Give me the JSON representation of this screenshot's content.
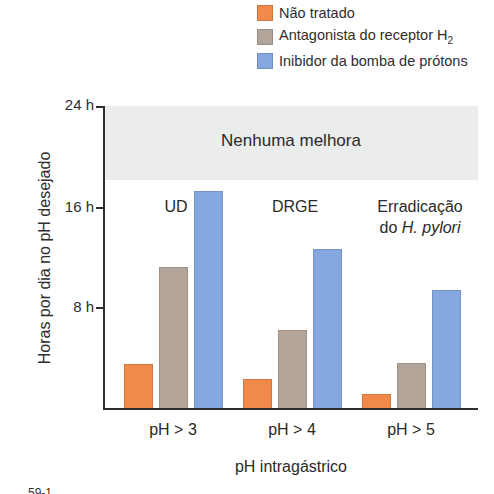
{
  "chart_data": {
    "type": "bar",
    "title": "",
    "xlabel": "pH intragástrico",
    "ylabel": "Horas por dia no pH desejado",
    "ylim": [
      0,
      24
    ],
    "yticks": [
      "8 h",
      "16 h",
      "24 h"
    ],
    "categories": [
      "pH > 3",
      "pH > 4",
      "pH > 5"
    ],
    "category_annotations": [
      "UD",
      "DRGE",
      "Erradicação do H. pylori"
    ],
    "series": [
      {
        "name": "Não tratado",
        "color": "#f0894a",
        "values": [
          3.5,
          2.3,
          1.1
        ]
      },
      {
        "name": "Antagonista do receptor H2",
        "color": "#b4a59a",
        "values": [
          11.2,
          6.2,
          3.6
        ]
      },
      {
        "name": "Inibidor da bomba de prótons",
        "color": "#85a9de",
        "values": [
          17.3,
          12.7,
          9.4
        ]
      }
    ],
    "shaded_region": {
      "from": 18,
      "to": 24,
      "label": "Nenhuma melhora",
      "color": "#ebedec"
    },
    "grid": false,
    "legend_position": "top-right"
  },
  "legend": [
    {
      "label": "Não tratado",
      "color": "#f0894a"
    },
    {
      "label_main": "Antagonista do receptor H",
      "label_sub": "2",
      "color": "#b4a59a"
    },
    {
      "label": "Inibidor da bomba de prótons",
      "color": "#85a9de"
    }
  ],
  "axis": {
    "y_ticks": [
      "24 h",
      "16 h",
      "8 h"
    ],
    "y_label": "Horas por dia no pH desejado",
    "x_label": "pH intragástrico"
  },
  "band_label": "Nenhuma melhora",
  "categories": [
    "pH > 3",
    "pH > 4",
    "pH > 5"
  ],
  "annotations": {
    "ud": "UD",
    "drge": "DRGE",
    "hp_line1": "Erradicação",
    "hp_line2_prefix": "do ",
    "hp_line2_italic": "H. pylori"
  },
  "figure_fragment": "59-1"
}
